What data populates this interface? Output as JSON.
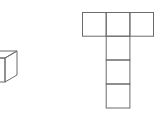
{
  "diagram": {
    "stroke_color": "#6b6b6b",
    "background": "#ffffff",
    "cube": {
      "label": "",
      "front_face": {
        "x": -19,
        "y": 58,
        "w": 24,
        "h": 24
      },
      "depth_offset": {
        "dx": 12,
        "dy": -7
      }
    },
    "net": {
      "shape": "T",
      "cell_size": 23.7,
      "top_row": {
        "x": 82,
        "y": 12,
        "cells": 3
      },
      "column": {
        "x": 106,
        "y": 36,
        "cells": 3
      }
    }
  }
}
